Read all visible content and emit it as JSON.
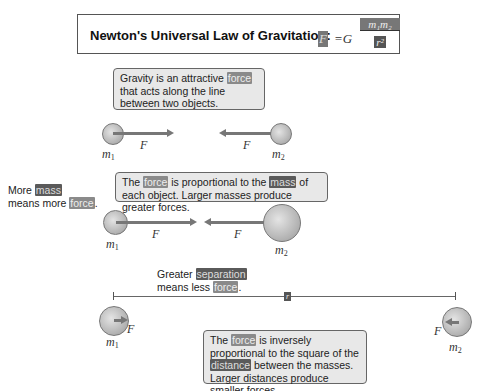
{
  "header": {
    "title": "Newton's Universal Law of Gravitation:",
    "equation": {
      "lhs": "F",
      "eq": "=G",
      "numerator": "m₁m₂",
      "denominator": "r²"
    }
  },
  "panel1": {
    "note": {
      "pre": "Gravity is an attractive ",
      "highlight": "force",
      "post": " that acts along the line between two objects."
    },
    "m1": "m",
    "m1_sub": "1",
    "m2": "m",
    "m2_sub": "2",
    "force_label": "F"
  },
  "panel2": {
    "side_note": {
      "pre": "More ",
      "hl1": "mass",
      "mid": " means more ",
      "hl2": "force",
      "post": "."
    },
    "note": {
      "pre": "The ",
      "hl1": "force",
      "mid": " is proportional to the ",
      "hl2": "mass",
      "post": " of each object. Larger masses produce greater forces."
    },
    "m1": "m",
    "m1_sub": "1",
    "m2": "m",
    "m2_sub": "2",
    "force_label": "F"
  },
  "panel3": {
    "top_note": {
      "pre": "Greater ",
      "hl1": "separation",
      "mid": " means less ",
      "hl2": "force",
      "post": "."
    },
    "distance_label": "r",
    "note": {
      "pre": "The ",
      "hl1": "force",
      "mid": " is inversely proportional to the square of the ",
      "hl2": "distance",
      "post": " between the masses. Larger distances produce smaller forces."
    },
    "m1": "m",
    "m1_sub": "1",
    "m2": "m",
    "m2_sub": "2",
    "force_label": "F"
  }
}
